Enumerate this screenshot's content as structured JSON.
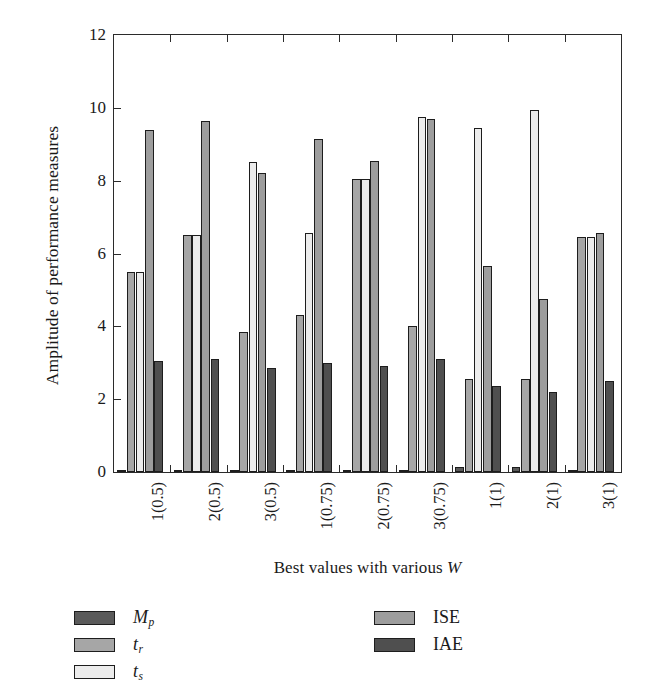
{
  "chart_data": {
    "type": "bar",
    "title": "",
    "xlabel": "Best values with various W",
    "ylabel": "Amplitude of performance measures",
    "categories": [
      "1(0.5)",
      "2(0.5)",
      "3(0.5)",
      "1(0.75)",
      "2(0.75)",
      "3(0.75)",
      "1(1)",
      "2(1)",
      "3(1)"
    ],
    "ylim": [
      0,
      12
    ],
    "yticks": [
      0,
      2,
      4,
      6,
      8,
      10,
      12
    ],
    "ytick_labels": [
      "0",
      "2",
      "4",
      "6",
      "8",
      "10",
      "12"
    ],
    "grid": false,
    "legend_position": "below-plot",
    "series": [
      {
        "name": "Mp",
        "label_html": "M<sub>p</sub>",
        "color": "#5a5a5a",
        "values": [
          0.02,
          0.02,
          0.06,
          0.06,
          0.03,
          0.06,
          0.15,
          0.13,
          0.02
        ]
      },
      {
        "name": "tr",
        "label_html": "t<sub>r</sub>",
        "color": "#a6a6a6",
        "values": [
          5.5,
          6.5,
          3.85,
          4.3,
          8.05,
          4.0,
          2.55,
          2.55,
          6.45
        ]
      },
      {
        "name": "ts",
        "label_html": "t<sub>s</sub>",
        "color": "#ececec",
        "values": [
          5.5,
          6.5,
          8.5,
          6.55,
          8.05,
          9.75,
          9.45,
          9.95,
          6.45
        ]
      },
      {
        "name": "ISE",
        "label_html": "ISE",
        "color": "#9d9d9d",
        "values": [
          9.4,
          9.65,
          8.2,
          9.15,
          8.55,
          9.7,
          5.65,
          4.75,
          6.55
        ]
      },
      {
        "name": "IAE",
        "label_html": "IAE",
        "color": "#4f4f4f",
        "values": [
          3.05,
          3.1,
          2.85,
          3.0,
          2.9,
          3.1,
          2.35,
          2.2,
          2.5
        ]
      }
    ]
  },
  "legend": {
    "column_1": [
      "Mp",
      "tr",
      "ts"
    ],
    "column_2": [
      "ISE",
      "IAE"
    ]
  },
  "axes": {
    "y_title": "Amplitude of performance measures",
    "x_title_prefix": "Best values with various ",
    "x_title_symbol": "W"
  }
}
